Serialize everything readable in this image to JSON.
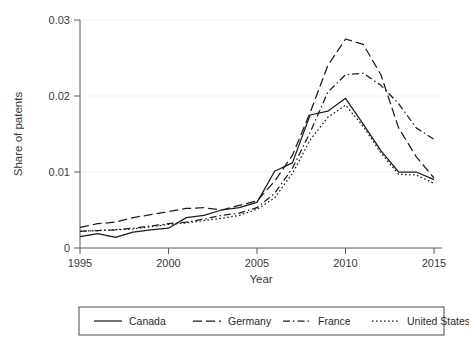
{
  "chart_data": {
    "type": "line",
    "title": "",
    "xlabel": "Year",
    "ylabel": "Share of patents",
    "xlim": [
      1995,
      2015
    ],
    "ylim": [
      0,
      0.03
    ],
    "grid": false,
    "legend_position": "bottom",
    "x": [
      1995,
      1996,
      1997,
      1998,
      1999,
      2000,
      2001,
      2002,
      2003,
      2004,
      2005,
      2006,
      2007,
      2008,
      2009,
      2010,
      2011,
      2012,
      2013,
      2014,
      2015
    ],
    "xticks": [
      "1995",
      "2000",
      "2005",
      "2010",
      "2015"
    ],
    "xtick_values": [
      1995,
      2000,
      2005,
      2010,
      2015
    ],
    "yticks": [
      "0",
      "0.01",
      "0.02",
      "0.03"
    ],
    "ytick_values": [
      0,
      0.01,
      0.02,
      0.03
    ],
    "series": [
      {
        "name": "Canada",
        "style": "solid",
        "values": [
          0.0015,
          0.0019,
          0.0014,
          0.0021,
          0.0024,
          0.0026,
          0.004,
          0.0043,
          0.005,
          0.0053,
          0.006,
          0.0101,
          0.0112,
          0.0175,
          0.018,
          0.0197,
          0.0163,
          0.0128,
          0.01,
          0.01,
          0.009
        ]
      },
      {
        "name": "Germany",
        "style": "long-dash",
        "values": [
          0.0027,
          0.0032,
          0.0034,
          0.004,
          0.0044,
          0.0048,
          0.0052,
          0.0053,
          0.005,
          0.0056,
          0.0062,
          0.0088,
          0.0122,
          0.0178,
          0.024,
          0.0275,
          0.0268,
          0.0228,
          0.0158,
          0.012,
          0.0092
        ]
      },
      {
        "name": "France",
        "style": "dash-dot",
        "values": [
          0.0022,
          0.0023,
          0.0024,
          0.0026,
          0.0029,
          0.0032,
          0.0034,
          0.0038,
          0.0043,
          0.0046,
          0.0053,
          0.0072,
          0.0105,
          0.0152,
          0.0205,
          0.0228,
          0.023,
          0.0214,
          0.019,
          0.0158,
          0.0143
        ]
      },
      {
        "name": "United States",
        "style": "dotted",
        "values": [
          0.0022,
          0.0023,
          0.0024,
          0.0025,
          0.0028,
          0.0031,
          0.0033,
          0.0036,
          0.0039,
          0.0043,
          0.0051,
          0.0066,
          0.0098,
          0.0142,
          0.0172,
          0.0188,
          0.016,
          0.0125,
          0.0097,
          0.0096,
          0.0085
        ]
      }
    ]
  },
  "legend": {
    "items": [
      {
        "label": "Canada",
        "style": "solid"
      },
      {
        "label": "Germany",
        "style": "long-dash"
      },
      {
        "label": "France",
        "style": "dash-dot"
      },
      {
        "label": "United States",
        "style": "dotted"
      }
    ]
  },
  "colors": {
    "line": "#1c1c1c",
    "axis": "#5a5a5a",
    "text": "#2b2b2b",
    "background": "#ffffff"
  }
}
